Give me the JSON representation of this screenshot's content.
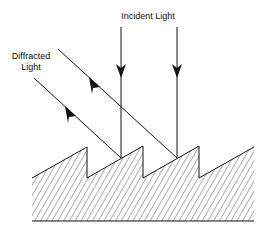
{
  "diagram": {
    "labels": {
      "incident": "Incident Light",
      "diffracted_line1": "Diffracted",
      "diffracted_line2": "Light"
    },
    "colors": {
      "stroke": "#111111",
      "hatch": "#333333",
      "background": "#ffffff"
    },
    "grating": {
      "teeth": 4,
      "hatched": true
    },
    "rays": {
      "incident_count": 2,
      "diffracted_count": 2
    }
  }
}
